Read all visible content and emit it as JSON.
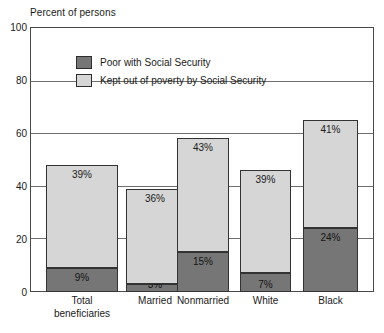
{
  "chart_data": {
    "type": "bar",
    "subtype": "stacked",
    "title": "Percent of persons",
    "xlabel": "",
    "ylabel": "Percent of persons",
    "ylim": [
      0,
      100
    ],
    "yticks": [
      0,
      20,
      40,
      60,
      80,
      100
    ],
    "grid": true,
    "legend_position": "inside-top-left",
    "categories": [
      "Total beneficiaries",
      "Married",
      "Nonmarried",
      "White",
      "Black"
    ],
    "category_lines": [
      [
        "Total",
        "beneficiaries"
      ],
      [
        "Married"
      ],
      [
        "Nonmarried"
      ],
      [
        "White"
      ],
      [
        "Black"
      ]
    ],
    "series": [
      {
        "name": "Poor with Social Security",
        "color": "#767676",
        "values": [
          9,
          3,
          15,
          7,
          24
        ],
        "labels": [
          "9%",
          "3%",
          "15%",
          "7%",
          "24%"
        ]
      },
      {
        "name": "Kept out of poverty by Social Security",
        "color": "#d6d6d6",
        "values": [
          39,
          36,
          43,
          39,
          41
        ],
        "labels": [
          "39%",
          "36%",
          "43%",
          "39%",
          "41%"
        ]
      }
    ],
    "totals": [
      48,
      39,
      58,
      46,
      65
    ]
  },
  "axis": {
    "title": "Percent of persons",
    "ticks": [
      "100",
      "80",
      "60",
      "40",
      "20",
      "0"
    ]
  },
  "legend": {
    "items": [
      {
        "label": "Poor with Social Security",
        "swatch": "dark"
      },
      {
        "label": "Kept out of poverty by Social Security",
        "swatch": "light"
      }
    ]
  }
}
